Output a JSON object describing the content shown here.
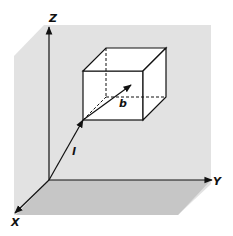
{
  "diagram": {
    "type": "3d-axes-with-cube",
    "axes": {
      "x_label": "X",
      "y_label": "Y",
      "z_label": "Z"
    },
    "vectors": [
      {
        "label": "l",
        "from": "origin",
        "to": "cube-front-bottom-left-corner"
      },
      {
        "label": "b",
        "from": "cube-front-bottom-left-corner",
        "to": "cube-interior"
      }
    ],
    "colors": {
      "background": "#ffffff",
      "back_panel": "#e2e2e2",
      "floor": "#c8c8c8",
      "cube_face": "#ffffff",
      "line": "#111111"
    }
  }
}
